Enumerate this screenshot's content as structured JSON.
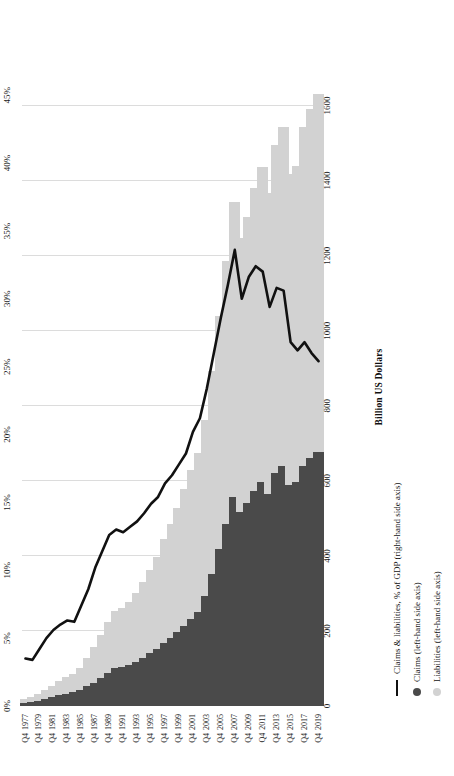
{
  "chart_data": {
    "type": "bar",
    "title": "",
    "subtitle": "",
    "orientation": "horizontal-stacked-bar-with-line",
    "xlabel": "Billion US Dollars",
    "ylabel": "",
    "secondary_axis_label": "",
    "xlim": [
      0,
      1700
    ],
    "secondary_ylim": [
      0,
      47
    ],
    "grid": true,
    "legend_position": "bottom",
    "categories": [
      "Q4 1977",
      "Q4 1978",
      "Q4 1979",
      "Q4 1980",
      "Q4 1981",
      "Q4 1982",
      "Q4 1983",
      "Q4 1984",
      "Q4 1985",
      "Q4 1986",
      "Q4 1987",
      "Q4 1988",
      "Q4 1989",
      "Q4 1990",
      "Q4 1991",
      "Q4 1992",
      "Q4 1993",
      "Q4 1994",
      "Q4 1995",
      "Q4 1996",
      "Q4 1997",
      "Q4 1998",
      "Q4 1999",
      "Q4 2000",
      "Q4 2001",
      "Q4 2002",
      "Q4 2003",
      "Q4 2004",
      "Q4 2005",
      "Q4 2006",
      "Q4 2007",
      "Q4 2008",
      "Q4 2009",
      "Q4 2010",
      "Q4 2011",
      "Q4 2012",
      "Q4 2013",
      "Q4 2014",
      "Q4 2015",
      "Q4 2016",
      "Q4 2017",
      "Q4 2018",
      "Q4 2019"
    ],
    "category_tick_labels": [
      {
        "q": "Q4",
        "year": "1977"
      },
      {
        "q": "Q4",
        "year": "1979"
      },
      {
        "q": "Q4",
        "year": "1981"
      },
      {
        "q": "Q4",
        "year": "1983"
      },
      {
        "q": "Q4",
        "year": "1985"
      },
      {
        "q": "Q4",
        "year": "1987"
      },
      {
        "q": "Q4",
        "year": "1989"
      },
      {
        "q": "Q4",
        "year": "1991"
      },
      {
        "q": "Q4",
        "year": "1993"
      },
      {
        "q": "Q4",
        "year": "1995"
      },
      {
        "q": "Q4",
        "year": "1997"
      },
      {
        "q": "Q4",
        "year": "1999"
      },
      {
        "q": "Q4",
        "year": "2001"
      },
      {
        "q": "Q4",
        "year": "2003"
      },
      {
        "q": "Q4",
        "year": "2005"
      },
      {
        "q": "Q4",
        "year": "2007"
      },
      {
        "q": "Q4",
        "year": "2009"
      },
      {
        "q": "Q4",
        "year": "2011"
      },
      {
        "q": "Q4",
        "year": "2013"
      },
      {
        "q": "Q4",
        "year": "2015"
      },
      {
        "q": "Q4",
        "year": "2017"
      },
      {
        "q": "Q4",
        "year": "2019"
      }
    ],
    "xticks": [
      0,
      200,
      400,
      600,
      800,
      1000,
      1200,
      1400,
      1600
    ],
    "xtick_labels": [
      "0",
      "200",
      "400",
      "600",
      "800",
      "1000",
      "1200",
      "1400",
      "1600"
    ],
    "secondary_ticks": [
      0,
      5,
      10,
      15,
      20,
      25,
      30,
      35,
      40,
      45
    ],
    "secondary_tick_labels": [
      "0%",
      "5%",
      "10%",
      "15%",
      "20%",
      "25%",
      "30%",
      "35%",
      "40%",
      "45%"
    ],
    "series": [
      {
        "name": "Claims (left-hand side axis)",
        "short_name": "Claims",
        "color": "#4a4a4a",
        "marker": "dot",
        "axis": "left",
        "values": [
          8,
          10,
          14,
          18,
          23,
          28,
          32,
          36,
          42,
          52,
          62,
          74,
          88,
          100,
          104,
          110,
          118,
          128,
          140,
          152,
          168,
          182,
          196,
          214,
          232,
          250,
          292,
          352,
          418,
          486,
          556,
          518,
          540,
          572,
          596,
          566,
          620,
          640,
          588,
          596,
          640,
          660,
          676
        ]
      },
      {
        "name": "Liabilities (left-hand side axis)",
        "short_name": "Liabilities",
        "color": "#d2d2d2",
        "marker": "dot",
        "axis": "left",
        "values": [
          10,
          13,
          18,
          24,
          31,
          38,
          44,
          50,
          60,
          76,
          94,
          114,
          136,
          152,
          158,
          168,
          184,
          202,
          222,
          244,
          276,
          302,
          332,
          364,
          396,
          424,
          470,
          540,
          620,
          700,
          786,
          730,
          762,
          808,
          840,
          800,
          876,
          904,
          830,
          842,
          904,
          930,
          954
        ]
      },
      {
        "name": "Claims & liabilities, % of GDP (right-hand side axis)",
        "short_name": "Claims & liabilities, % of GDP",
        "color": "#111111",
        "marker": "line",
        "axis": "right",
        "values": [
          3.5,
          3.4,
          4.2,
          5.0,
          5.6,
          6.0,
          6.3,
          6.2,
          7.4,
          8.6,
          10.2,
          11.4,
          12.6,
          13.0,
          12.8,
          13.2,
          13.6,
          14.2,
          14.9,
          15.4,
          16.4,
          17.0,
          17.8,
          18.6,
          20.2,
          21.2,
          23.4,
          26.0,
          28.6,
          31.0,
          33.6,
          30.0,
          31.6,
          32.4,
          32.0,
          29.4,
          30.8,
          30.6,
          26.8,
          26.2,
          26.8,
          26.0,
          25.4
        ]
      }
    ]
  },
  "axis": {
    "bottom_title": "Billion US Dollars"
  },
  "legend": {
    "items": [
      {
        "label": "Claims & liabilities, % of GDP (right-hand side axis)",
        "marker": "line-marker"
      },
      {
        "label": "Claims (left-hand side axis)",
        "marker": "claims-dot-marker"
      },
      {
        "label": "Liabilities (left-hand side axis)",
        "marker": "liabilities-dot-marker"
      }
    ]
  },
  "colors": {
    "claims": "#4a4a4a",
    "liabilities": "#d2d2d2",
    "line": "#111111",
    "grid": "#dcdcdc",
    "background": "#ffffff"
  }
}
